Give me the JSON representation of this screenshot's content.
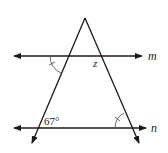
{
  "diagram": {
    "lines": {
      "m": "m",
      "n": "n"
    },
    "labels": {
      "unknown_angle": "z",
      "given_angle": "67°"
    },
    "colors": {
      "stroke": "#1a1a1a",
      "arc": "#555555",
      "background": "#ffffff"
    }
  }
}
